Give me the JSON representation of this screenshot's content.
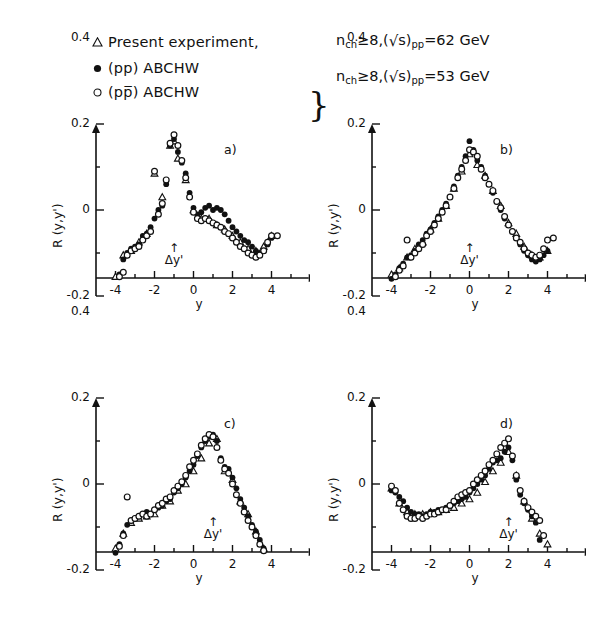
{
  "legend": {
    "rows": [
      {
        "marker": "open-triangle",
        "text": "Present experiment,"
      },
      {
        "marker": "filled-circle",
        "text": "(pp) ABCHW"
      },
      {
        "marker": "open-circle",
        "text": "(pp̅) ABCHW"
      }
    ],
    "brace": "}",
    "condition_62": {
      "n": "n",
      "n_sub": "ch",
      "ge": "≥8,(",
      "radical": "√",
      "s": "s",
      ")": ")",
      "s_sub": "pp",
      "energy": "=62 GeV"
    },
    "condition_53": {
      "n": "n",
      "n_sub": "ch",
      "ge": "≥8,(",
      "radical": "√",
      "s": "s",
      ")": ")",
      "s_sub": "pp",
      "energy": "=53 GeV"
    }
  },
  "axes": {
    "ylabel": "R (y,y')",
    "xlabel": "y",
    "ytick_labels": [
      "0.4",
      "0.2",
      "0",
      "-0.2"
    ],
    "ytick_values": [
      0.4,
      0.2,
      0,
      -0.2
    ],
    "xtick_labels": [
      "-4",
      "-2",
      "0",
      "2",
      "4"
    ],
    "xtick_values": [
      -4,
      -2,
      0,
      2,
      4
    ],
    "delta_marker": "Δy'",
    "arrow": "↑"
  },
  "chart_data": [
    {
      "type": "scatter",
      "panel": "a)",
      "title": "",
      "xlabel": "y",
      "ylabel": "R (y,y')",
      "xlim": [
        -5,
        5.6
      ],
      "ylim": [
        -0.28,
        0.52
      ],
      "grid": false,
      "delta_y_prime": -1,
      "legend_position": "top",
      "series": [
        {
          "name": "Present experiment",
          "marker": "open-triangle",
          "x": [
            -4.0,
            -3.6,
            -3.2,
            -2.8,
            -2.4,
            -2.0,
            -1.6,
            -1.2,
            -1.0,
            -0.8,
            -0.4,
            0.0,
            0.4,
            0.8,
            1.2,
            1.6,
            2.0,
            2.4,
            2.8,
            3.2,
            3.6,
            4.0
          ],
          "y": [
            -0.155,
            -0.105,
            -0.095,
            -0.075,
            -0.055,
            0.085,
            0.03,
            0.15,
            0.16,
            0.12,
            0.07,
            0.0,
            -0.02,
            -0.02,
            -0.035,
            -0.045,
            -0.06,
            -0.075,
            -0.09,
            -0.095,
            -0.085,
            -0.06
          ]
        },
        {
          "name": "(pp) ABCHW",
          "marker": "filled-circle",
          "x": [
            -4.0,
            -3.8,
            -3.6,
            -3.4,
            -3.2,
            -3.0,
            -2.8,
            -2.6,
            -2.4,
            -2.2,
            -2.0,
            -1.8,
            -1.6,
            -1.4,
            -1.2,
            -1.0,
            -0.8,
            -0.6,
            -0.4,
            -0.2,
            0.0,
            0.2,
            0.4,
            0.6,
            0.8,
            1.0,
            1.2,
            1.4,
            1.6,
            1.8,
            2.0,
            2.2,
            2.4,
            2.6,
            2.8,
            3.0,
            3.2,
            3.4,
            3.6,
            3.8,
            4.0
          ],
          "y": [
            -0.2,
            -0.15,
            -0.115,
            -0.1,
            -0.09,
            -0.085,
            -0.08,
            -0.06,
            -0.055,
            -0.04,
            -0.02,
            0.0,
            0.01,
            0.06,
            0.15,
            0.165,
            0.135,
            0.11,
            0.085,
            0.04,
            0.005,
            -0.01,
            -0.005,
            0.005,
            0.01,
            0.0,
            0.005,
            0.0,
            -0.01,
            -0.025,
            -0.04,
            -0.05,
            -0.06,
            -0.07,
            -0.075,
            -0.085,
            -0.095,
            -0.1,
            -0.095,
            -0.08,
            -0.065
          ]
        },
        {
          "name": "(pp̅) ABCHW",
          "marker": "open-circle",
          "x": [
            -4.0,
            -3.8,
            -3.6,
            -3.4,
            -3.2,
            -3.0,
            -2.8,
            -2.6,
            -2.4,
            -2.2,
            -2.0,
            -1.8,
            -1.6,
            -1.4,
            -1.2,
            -1.0,
            -0.8,
            -0.6,
            -0.4,
            -0.2,
            0.0,
            0.2,
            0.4,
            0.6,
            0.8,
            1.0,
            1.2,
            1.4,
            1.6,
            1.8,
            2.0,
            2.2,
            2.4,
            2.6,
            2.8,
            3.0,
            3.2,
            3.4,
            3.6,
            3.8,
            4.0,
            4.3
          ],
          "y": [
            -0.205,
            -0.155,
            -0.145,
            -0.105,
            -0.095,
            -0.09,
            -0.085,
            -0.07,
            -0.06,
            -0.05,
            0.09,
            -0.01,
            0.015,
            0.07,
            0.155,
            0.175,
            0.15,
            0.115,
            0.075,
            0.03,
            -0.005,
            -0.02,
            -0.025,
            -0.02,
            -0.025,
            -0.03,
            -0.035,
            -0.04,
            -0.05,
            -0.055,
            -0.065,
            -0.075,
            -0.085,
            -0.09,
            -0.1,
            -0.105,
            -0.11,
            -0.105,
            -0.095,
            -0.075,
            -0.06,
            -0.06
          ]
        }
      ]
    },
    {
      "type": "scatter",
      "panel": "b)",
      "title": "",
      "xlabel": "y",
      "ylabel": "R (y,y')",
      "xlim": [
        -5,
        5.6
      ],
      "ylim": [
        -0.28,
        0.52
      ],
      "grid": false,
      "delta_y_prime": 0,
      "legend_position": "top",
      "series": [
        {
          "name": "Present experiment",
          "marker": "open-triangle",
          "x": [
            -4.0,
            -3.6,
            -3.2,
            -2.8,
            -2.4,
            -2.0,
            -1.6,
            -1.2,
            -0.8,
            -0.4,
            0.0,
            0.4,
            0.8,
            1.2,
            1.6,
            2.0,
            2.4,
            2.8,
            3.2,
            3.6,
            4.0
          ],
          "y": [
            -0.15,
            -0.135,
            -0.11,
            -0.09,
            -0.075,
            -0.045,
            -0.02,
            0.01,
            0.05,
            0.09,
            0.13,
            0.105,
            0.08,
            0.045,
            0.01,
            -0.03,
            -0.055,
            -0.085,
            -0.105,
            -0.11,
            -0.095
          ]
        },
        {
          "name": "(pp) ABCHW",
          "marker": "filled-circle",
          "x": [
            -4.0,
            -3.8,
            -3.6,
            -3.4,
            -3.2,
            -3.0,
            -2.8,
            -2.6,
            -2.4,
            -2.2,
            -2.0,
            -1.8,
            -1.6,
            -1.4,
            -1.2,
            -1.0,
            -0.8,
            -0.6,
            -0.4,
            -0.2,
            0.0,
            0.2,
            0.4,
            0.6,
            0.8,
            1.0,
            1.2,
            1.4,
            1.6,
            1.8,
            2.0,
            2.2,
            2.4,
            2.6,
            2.8,
            3.0,
            3.2,
            3.4,
            3.6,
            3.8,
            4.0
          ],
          "y": [
            -0.16,
            -0.15,
            -0.135,
            -0.125,
            -0.11,
            -0.105,
            -0.095,
            -0.08,
            -0.07,
            -0.055,
            -0.045,
            -0.03,
            -0.015,
            0.0,
            0.015,
            0.03,
            0.055,
            0.08,
            0.1,
            0.125,
            0.16,
            0.14,
            0.115,
            0.1,
            0.08,
            0.06,
            0.04,
            0.02,
            0.0,
            -0.02,
            -0.035,
            -0.05,
            -0.065,
            -0.08,
            -0.095,
            -0.105,
            -0.115,
            -0.12,
            -0.115,
            -0.105,
            -0.095
          ]
        },
        {
          "name": "(pp̅) ABCHW",
          "marker": "open-circle",
          "x": [
            -4.0,
            -3.8,
            -3.6,
            -3.4,
            -3.2,
            -3.0,
            -2.8,
            -2.6,
            -2.4,
            -2.2,
            -2.0,
            -1.8,
            -1.6,
            -1.4,
            -1.2,
            -1.0,
            -0.8,
            -0.6,
            -0.4,
            -0.2,
            0.0,
            0.2,
            0.4,
            0.6,
            0.8,
            1.0,
            1.2,
            1.4,
            1.6,
            1.8,
            2.0,
            2.2,
            2.4,
            2.6,
            2.8,
            3.0,
            3.2,
            3.4,
            3.6,
            3.8,
            4.0,
            4.3
          ],
          "y": [
            -0.195,
            -0.155,
            -0.14,
            -0.13,
            -0.07,
            -0.11,
            -0.1,
            -0.09,
            -0.08,
            -0.06,
            -0.05,
            -0.035,
            -0.02,
            -0.005,
            0.01,
            0.03,
            0.05,
            0.075,
            0.095,
            0.115,
            0.14,
            0.135,
            0.125,
            0.095,
            0.075,
            0.06,
            0.045,
            0.02,
            0.005,
            -0.015,
            -0.035,
            -0.05,
            -0.065,
            -0.075,
            -0.09,
            -0.1,
            -0.105,
            -0.11,
            -0.105,
            -0.09,
            -0.07,
            -0.065
          ]
        }
      ]
    },
    {
      "type": "scatter",
      "panel": "c)",
      "title": "",
      "xlabel": "y",
      "ylabel": "R (y,y')",
      "xlim": [
        -5,
        5.6
      ],
      "ylim": [
        -0.28,
        0.52
      ],
      "grid": false,
      "delta_y_prime": 1,
      "legend_position": "top",
      "series": [
        {
          "name": "Present experiment",
          "marker": "open-triangle",
          "x": [
            -4.0,
            -3.6,
            -3.2,
            -2.8,
            -2.4,
            -2.0,
            -1.6,
            -1.2,
            -0.8,
            -0.4,
            0.0,
            0.4,
            0.8,
            1.2,
            1.6,
            2.0,
            2.4,
            2.8,
            3.2,
            3.6,
            4.0
          ],
          "y": [
            -0.15,
            -0.115,
            -0.09,
            -0.08,
            -0.075,
            -0.07,
            -0.05,
            -0.04,
            -0.015,
            0.0,
            0.03,
            0.06,
            0.095,
            0.105,
            0.03,
            0.01,
            -0.04,
            -0.07,
            -0.11,
            -0.15,
            -0.175
          ]
        },
        {
          "name": "(pp) ABCHW",
          "marker": "filled-circle",
          "x": [
            -4.0,
            -3.8,
            -3.6,
            -3.4,
            -3.2,
            -3.0,
            -2.8,
            -2.6,
            -2.4,
            -2.2,
            -2.0,
            -1.8,
            -1.6,
            -1.4,
            -1.2,
            -1.0,
            -0.8,
            -0.6,
            -0.4,
            -0.2,
            0.0,
            0.2,
            0.4,
            0.6,
            0.8,
            1.0,
            1.2,
            1.4,
            1.6,
            1.8,
            2.0,
            2.2,
            2.4,
            2.6,
            2.8,
            3.0,
            3.2,
            3.4,
            3.6,
            3.8,
            4.0
          ],
          "y": [
            -0.16,
            -0.14,
            -0.115,
            -0.095,
            -0.085,
            -0.08,
            -0.075,
            -0.07,
            -0.065,
            -0.07,
            -0.06,
            -0.055,
            -0.05,
            -0.04,
            -0.035,
            -0.02,
            -0.01,
            0.0,
            0.015,
            0.03,
            0.045,
            0.065,
            0.085,
            0.1,
            0.11,
            0.115,
            0.1,
            0.06,
            0.04,
            0.035,
            0.015,
            -0.01,
            -0.035,
            -0.055,
            -0.075,
            -0.095,
            -0.11,
            -0.13,
            -0.15,
            -0.165,
            -0.175
          ]
        },
        {
          "name": "(pp̅) ABCHW",
          "marker": "open-circle",
          "x": [
            -4.0,
            -3.8,
            -3.6,
            -3.4,
            -3.2,
            -3.0,
            -2.8,
            -2.6,
            -2.4,
            -2.2,
            -2.0,
            -1.8,
            -1.6,
            -1.4,
            -1.2,
            -1.0,
            -0.8,
            -0.6,
            -0.4,
            -0.2,
            0.0,
            0.2,
            0.4,
            0.6,
            0.8,
            1.0,
            1.2,
            1.4,
            1.6,
            1.8,
            2.0,
            2.2,
            2.4,
            2.6,
            2.8,
            3.0,
            3.2,
            3.4,
            3.6,
            3.8,
            4.0
          ],
          "y": [
            -0.165,
            -0.145,
            -0.12,
            -0.03,
            -0.085,
            -0.08,
            -0.075,
            -0.07,
            -0.075,
            -0.07,
            -0.06,
            -0.05,
            -0.045,
            -0.035,
            -0.03,
            -0.015,
            -0.005,
            0.005,
            0.02,
            0.04,
            0.055,
            0.07,
            0.09,
            0.105,
            0.115,
            0.11,
            0.085,
            0.055,
            0.035,
            0.025,
            0.0,
            -0.025,
            -0.045,
            -0.065,
            -0.085,
            -0.1,
            -0.12,
            -0.14,
            -0.155,
            -0.17,
            -0.18
          ]
        }
      ]
    },
    {
      "type": "scatter",
      "panel": "d)",
      "title": "",
      "xlabel": "y",
      "ylabel": "R (y,y')",
      "xlim": [
        -5,
        5.6
      ],
      "ylim": [
        -0.28,
        0.52
      ],
      "grid": false,
      "delta_y_prime": 2,
      "legend_position": "top",
      "series": [
        {
          "name": "Present experiment",
          "marker": "open-triangle",
          "x": [
            -4.0,
            -3.6,
            -3.2,
            -2.8,
            -2.4,
            -2.0,
            -1.6,
            -1.2,
            -0.8,
            -0.4,
            0.0,
            0.4,
            0.8,
            1.2,
            1.6,
            2.0,
            2.4,
            2.8,
            3.2,
            3.6,
            4.0
          ],
          "y": [
            -0.01,
            -0.045,
            -0.065,
            -0.07,
            -0.07,
            -0.065,
            -0.065,
            -0.06,
            -0.055,
            -0.045,
            -0.035,
            -0.02,
            0.005,
            0.03,
            0.05,
            0.075,
            0.02,
            -0.04,
            -0.08,
            -0.115,
            -0.14
          ]
        },
        {
          "name": "(pp) ABCHW",
          "marker": "filled-circle",
          "x": [
            -4.0,
            -3.8,
            -3.6,
            -3.4,
            -3.2,
            -3.0,
            -2.8,
            -2.6,
            -2.4,
            -2.2,
            -2.0,
            -1.8,
            -1.6,
            -1.4,
            -1.2,
            -1.0,
            -0.8,
            -0.6,
            -0.4,
            -0.2,
            0.0,
            0.2,
            0.4,
            0.6,
            0.8,
            1.0,
            1.2,
            1.4,
            1.6,
            1.8,
            2.0,
            2.2,
            2.4,
            2.6,
            2.8,
            3.0,
            3.2,
            3.4,
            3.6,
            3.8,
            4.0
          ],
          "y": [
            -0.015,
            -0.02,
            -0.03,
            -0.04,
            -0.055,
            -0.065,
            -0.07,
            -0.07,
            -0.075,
            -0.07,
            -0.065,
            -0.065,
            -0.06,
            -0.06,
            -0.055,
            -0.05,
            -0.045,
            -0.04,
            -0.035,
            -0.03,
            -0.02,
            -0.01,
            0.0,
            0.01,
            0.02,
            0.035,
            0.05,
            0.055,
            0.06,
            0.075,
            0.085,
            0.055,
            0.01,
            -0.025,
            -0.045,
            -0.06,
            -0.075,
            -0.09,
            -0.13,
            -0.17,
            -0.205
          ]
        },
        {
          "name": "(pp̅) ABCHW",
          "marker": "open-circle",
          "x": [
            -4.0,
            -3.8,
            -3.6,
            -3.4,
            -3.2,
            -3.0,
            -2.8,
            -2.6,
            -2.4,
            -2.2,
            -2.0,
            -1.8,
            -1.6,
            -1.4,
            -1.2,
            -1.0,
            -0.8,
            -0.6,
            -0.4,
            -0.2,
            0.0,
            0.2,
            0.4,
            0.6,
            0.8,
            1.0,
            1.2,
            1.4,
            1.6,
            1.8,
            2.0,
            2.2,
            2.4,
            2.6,
            2.8,
            3.0,
            3.2,
            3.4,
            3.6,
            3.8,
            4.0
          ],
          "y": [
            -0.005,
            -0.015,
            -0.045,
            -0.06,
            -0.075,
            -0.08,
            -0.08,
            -0.075,
            -0.08,
            -0.075,
            -0.07,
            -0.07,
            -0.065,
            -0.06,
            -0.06,
            -0.05,
            -0.04,
            -0.03,
            -0.025,
            -0.02,
            -0.015,
            0.0,
            0.01,
            0.02,
            0.03,
            0.045,
            0.055,
            0.07,
            0.085,
            0.095,
            0.105,
            0.065,
            0.02,
            -0.015,
            -0.04,
            -0.055,
            -0.065,
            -0.075,
            -0.085,
            -0.12,
            -0.165
          ]
        }
      ]
    }
  ]
}
